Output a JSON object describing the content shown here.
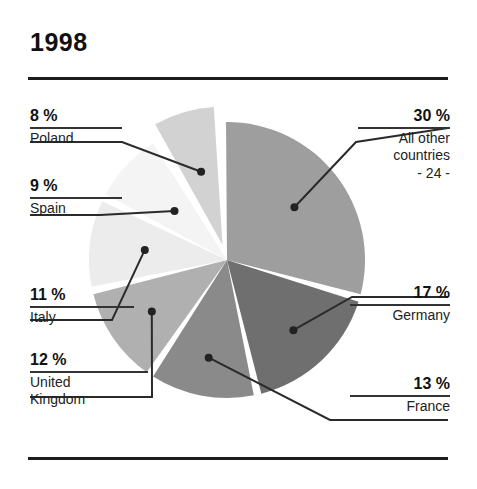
{
  "header": {
    "title": "1998"
  },
  "chart_data": {
    "type": "pie",
    "title": "1998",
    "xlabel": "",
    "ylabel": "",
    "legend_position": "callout-labels",
    "grid": false,
    "units": "%",
    "total": 100,
    "categories": [
      "All other countries",
      "Germany",
      "France",
      "United Kingdom",
      "Italy",
      "Spain",
      "Poland"
    ],
    "values": [
      30,
      17,
      13,
      12,
      11,
      9,
      8
    ],
    "slices": [
      {
        "label": "All other countries",
        "sublabel": "- 24 -",
        "value": 30,
        "pct_text": "30 %",
        "color": "#9e9e9e",
        "exploded": false,
        "side": "right"
      },
      {
        "label": "Germany",
        "sublabel": "",
        "value": 17,
        "pct_text": "17 %",
        "color": "#6f6f6f",
        "exploded": false,
        "side": "right"
      },
      {
        "label": "France",
        "sublabel": "",
        "value": 13,
        "pct_text": "13 %",
        "color": "#8a8a8a",
        "exploded": false,
        "side": "right"
      },
      {
        "label": "United Kingdom",
        "sublabel": "",
        "value": 12,
        "pct_text": "12 %",
        "color": "#b0b0b0",
        "exploded": false,
        "side": "left"
      },
      {
        "label": "Italy",
        "sublabel": "",
        "value": 11,
        "pct_text": "11 %",
        "color": "#ececec",
        "exploded": false,
        "side": "left"
      },
      {
        "label": "Spain",
        "sublabel": "",
        "value": 9,
        "pct_text": "9 %",
        "color": "#f4f4f4",
        "exploded": false,
        "side": "left"
      },
      {
        "label": "Poland",
        "sublabel": "",
        "value": 8,
        "pct_text": "8 %",
        "color": "#d2d2d2",
        "exploded": true,
        "side": "left"
      }
    ]
  }
}
